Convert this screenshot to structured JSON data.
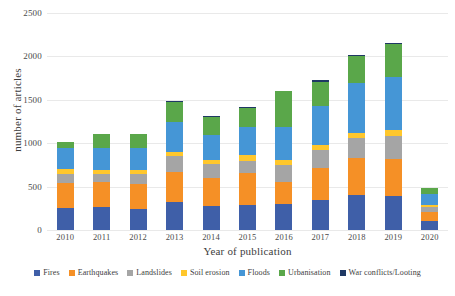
{
  "chart_data": {
    "type": "bar",
    "stacked": true,
    "title": "",
    "xlabel": "Year of publication",
    "ylabel": "number of articles",
    "ylim": [
      0,
      2500
    ],
    "yticks": [
      0,
      500,
      1000,
      1500,
      2000,
      2500
    ],
    "ytick_labels": [
      "0",
      "500",
      "1000",
      "1500",
      "2000",
      "2500"
    ],
    "grid": true,
    "legend_position": "bottom",
    "categories": [
      "2010",
      "2011",
      "2012",
      "2013",
      "2014",
      "2015",
      "2016",
      "2017",
      "2018",
      "2019",
      "2020"
    ],
    "series": [
      {
        "name": "Fires",
        "color": "#3f5fa8",
        "values": [
          250,
          260,
          245,
          320,
          275,
          290,
          305,
          345,
          405,
          390,
          100
        ]
      },
      {
        "name": "Earthquakes",
        "color": "#f59026",
        "values": [
          290,
          290,
          290,
          350,
          325,
          370,
          250,
          370,
          425,
          430,
          110
        ]
      },
      {
        "name": "Landslides",
        "color": "#a5a5a5",
        "values": [
          110,
          90,
          110,
          180,
          155,
          140,
          195,
          205,
          225,
          265,
          50
        ]
      },
      {
        "name": "Soil erosion",
        "color": "#ffc72c",
        "values": [
          50,
          50,
          45,
          45,
          55,
          60,
          60,
          55,
          65,
          70,
          25
        ]
      },
      {
        "name": "Floods",
        "color": "#4596d6",
        "values": [
          240,
          255,
          250,
          350,
          280,
          330,
          375,
          450,
          570,
          610,
          130
        ]
      },
      {
        "name": "Urbanisation",
        "color": "#5aa74a",
        "values": [
          70,
          165,
          165,
          225,
          210,
          215,
          415,
          280,
          320,
          375,
          75
        ]
      },
      {
        "name": "War conflicts/Looting",
        "color": "#1f3864",
        "values": [
          0,
          0,
          0,
          20,
          10,
          10,
          0,
          20,
          10,
          10,
          0
        ]
      }
    ],
    "totals": [
      1010,
      1110,
      1105,
      1490,
      1310,
      1415,
      1600,
      1725,
      2020,
      2150,
      490
    ]
  }
}
